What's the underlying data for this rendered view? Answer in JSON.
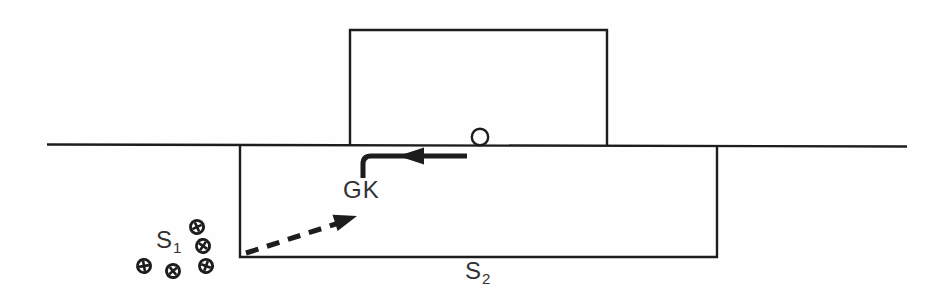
{
  "page": {
    "background": "#fefefe",
    "ink": "#1d1d1d",
    "label_color": "#323232"
  },
  "diagram": {
    "ground_line": {
      "x1": 47,
      "y1": 144.5,
      "x2": 907,
      "y2": 146.5,
      "width": 2.4
    },
    "upper_box": {
      "left": 350,
      "top": 30,
      "right": 607,
      "bottom": 145,
      "stroke": 2.4
    },
    "lower_box": {
      "left": 240,
      "top": 145,
      "right": 717,
      "bottom": 257,
      "stroke": 2.4
    },
    "ball": {
      "cx": 480,
      "cy": 137,
      "r": 8.2,
      "stroke": 2.4
    },
    "solid_arrow": {
      "path": "M 467 156 L 371 156 Q 363 156 363 164 L 363 178",
      "width": 5,
      "head": {
        "tip_x": 398,
        "tip_y": 156,
        "angle_deg": 180,
        "length": 26,
        "half_width": 8.5
      }
    },
    "dashed_arrow": {
      "x1": 246,
      "y1": 253,
      "x2": 339,
      "y2": 223,
      "width": 5,
      "dash": "13 9",
      "head": {
        "tip_x": 357,
        "tip_y": 216,
        "angle_deg": -17.5,
        "length": 23,
        "half_width": 8.5
      }
    },
    "spectators": {
      "ball_r": 8,
      "positions": [
        {
          "cx": 197,
          "cy": 227,
          "rot": 20
        },
        {
          "cx": 203,
          "cy": 246,
          "rot": -10
        },
        {
          "cx": 144,
          "cy": 266,
          "rot": 35
        },
        {
          "cx": 173,
          "cy": 271,
          "rot": 5
        },
        {
          "cx": 206,
          "cy": 266,
          "rot": -25
        }
      ]
    }
  },
  "labels": {
    "gk": {
      "text": "GK",
      "x": 343,
      "y": 178
    },
    "s1": {
      "base": "S",
      "sub": "1",
      "x": 156,
      "y": 228
    },
    "s2": {
      "base": "S",
      "sub": "2",
      "x": 465,
      "y": 259
    }
  }
}
